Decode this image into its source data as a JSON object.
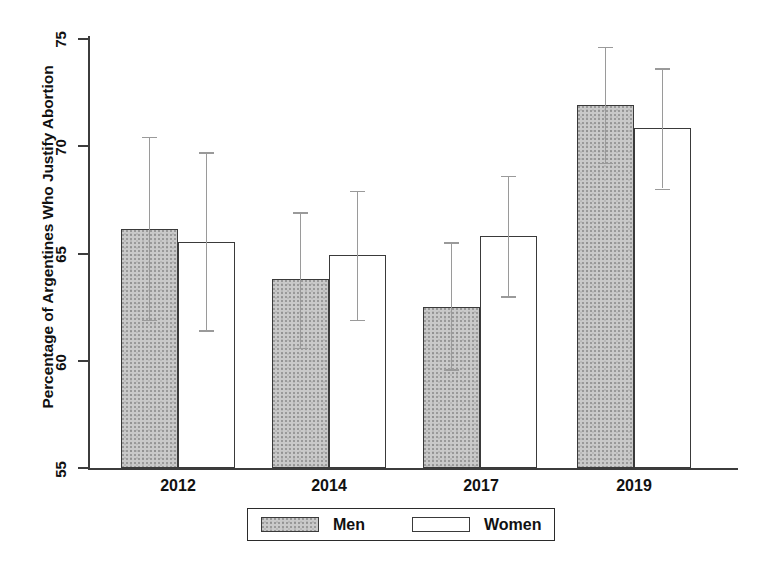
{
  "chart_data": {
    "type": "bar",
    "title": "",
    "subtitle": "",
    "xlabel": "",
    "ylabel": "Percentage of Argentines Who Justify Abortion",
    "categories": [
      "2012",
      "2014",
      "2017",
      "2019"
    ],
    "ylim": [
      55,
      75
    ],
    "yticks": [
      55,
      60,
      65,
      70,
      75
    ],
    "ytick_labels": [
      "55",
      "60",
      "65",
      "70",
      "75"
    ],
    "grid": false,
    "legend_position": "bottom-center",
    "error_bars": "95% confidence interval",
    "series": [
      {
        "name": "Men",
        "color": "#c9c9c9",
        "fill": "gray-hatch",
        "values": [
          66.1,
          63.8,
          62.5,
          71.9
        ],
        "ci_low": [
          61.9,
          60.6,
          59.6,
          69.2
        ],
        "ci_high": [
          70.4,
          66.9,
          65.5,
          74.6
        ]
      },
      {
        "name": "Women",
        "color": "#ffffff",
        "fill": "white",
        "values": [
          65.5,
          64.9,
          65.8,
          70.8
        ],
        "ci_low": [
          61.4,
          61.9,
          63.0,
          68.0
        ],
        "ci_high": [
          69.7,
          67.9,
          68.6,
          73.6
        ]
      }
    ]
  },
  "axis": {
    "y_title": "Percentage of Argentines Who Justify Abortion",
    "y_tick_0": "55",
    "y_tick_1": "60",
    "y_tick_2": "65",
    "y_tick_3": "70",
    "y_tick_4": "75",
    "x_tick_0": "2012",
    "x_tick_1": "2014",
    "x_tick_2": "2017",
    "x_tick_3": "2019"
  },
  "legend": {
    "entries": [
      {
        "label": "Men",
        "swatch": "gray"
      },
      {
        "label": "Women",
        "swatch": "white"
      }
    ],
    "men_label": "Men",
    "women_label": "Women"
  }
}
